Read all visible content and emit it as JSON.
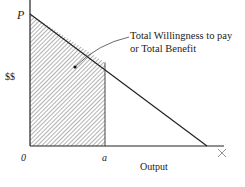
{
  "diagram": {
    "y_axis_label": "$$",
    "x_axis_label": "Output",
    "origin_label": "0",
    "price_intercept_label": "P",
    "quantity_label": "a",
    "x_end_label": "X",
    "annotation_line1": "Total Willingness to pay",
    "annotation_line2": "or Total Benefit"
  },
  "colors": {
    "line": "#222222",
    "hatch": "#444444",
    "background": "#ffffff"
  }
}
